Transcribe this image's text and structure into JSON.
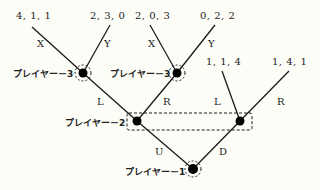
{
  "figure": {
    "type": "extensive-form-game-tree",
    "players": {
      "p1": "プレイヤー－1",
      "p2": "プレイヤー－2",
      "p3_left": "プレイヤー－3",
      "p3_right": "プレイヤー－3"
    },
    "actions": {
      "p1_up": "U",
      "p1_down": "D",
      "p2_left_L": "L",
      "p2_left_R": "R",
      "p2_right_L": "L",
      "p2_right_R": "R",
      "p3a_X": "X",
      "p3a_Y": "Y",
      "p3b_X": "X",
      "p3b_Y": "Y"
    },
    "payoffs": {
      "ULX": "4, 1, 1",
      "ULY": "2, 3, 0",
      "URX": "2, 0, 3",
      "URY": "0, 2, 2",
      "DL": "1, 1, 4",
      "DR": "1, 4, 1"
    },
    "colors": {
      "line": "#1a1a1a",
      "node": "#000000",
      "background": "#fdfdf8"
    }
  }
}
